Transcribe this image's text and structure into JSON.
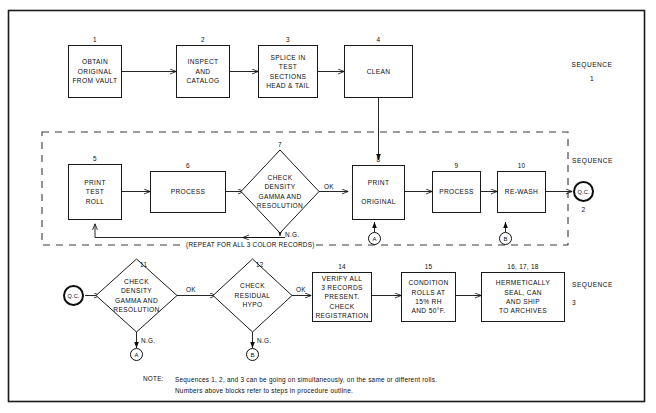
{
  "diagram": {
    "border_color": "#1a1a1a",
    "background": "#ffffff"
  },
  "sequences": [
    {
      "label": "SEQUENCE",
      "number": "1"
    },
    {
      "label": "SEQUENCE",
      "number": "2"
    },
    {
      "label": "SEQUENCE",
      "number": "3"
    }
  ],
  "nodes": {
    "n1": {
      "num": "1",
      "text": "OBTAIN\nORIGINAL\nFROM VAULT"
    },
    "n2": {
      "num": "2",
      "text": "INSPECT\nAND\nCATALOG"
    },
    "n3": {
      "num": "3",
      "text": "SPLICE IN\nTEST\nSECTIONS\nHEAD & TAIL"
    },
    "n4": {
      "num": "4",
      "text": "CLEAN"
    },
    "n5": {
      "num": "5",
      "text": "PRINT\nTEST\nROLL"
    },
    "n6": {
      "num": "6",
      "text": "PROCESS"
    },
    "n7": {
      "num": "7",
      "text": "CHECK\nDENSITY\nGAMMA AND\nRESOLUTION"
    },
    "n8": {
      "num": "8",
      "text": "PRINT\n\nORIGINAL"
    },
    "n9": {
      "num": "9",
      "text": "PROCESS"
    },
    "n10": {
      "num": "10",
      "text": "RE-WASH"
    },
    "n11": {
      "num": "11",
      "text": "CHECK\nDENSITY\nGAMMA AND\nRESOLUTION"
    },
    "n12": {
      "num": "12",
      "text": "CHECK\nRESIDUAL\nHYPO"
    },
    "n14": {
      "num": "14",
      "text": "VERIFY ALL\n3 RECORDS\nPRESENT.\nCHECK\nREGISTRATION"
    },
    "n15": {
      "num": "15",
      "text": "CONDITION\nROLLS AT\n15% RH\nAND 50°F."
    },
    "n16": {
      "num": "16, 17, 18",
      "text": "HERMETICALLY\nSEAL, CAN\nAND SHIP\nTO ARCHIVES"
    }
  },
  "connectors": {
    "qc2": "Q.C.",
    "qc3": "Q.C.",
    "a_seq2": "A",
    "b_seq2": "B",
    "a_seq3": "A",
    "b_seq3": "B"
  },
  "edge_labels": {
    "ok7": "OK",
    "ng7": "N.G.",
    "ok11": "OK",
    "ng11": "N.G.",
    "ok12": "OK",
    "ng12": "N.G."
  },
  "repeat_note": "(REPEAT FOR ALL 3 COLOR RECORDS)",
  "note": {
    "label": "NOTE:",
    "line1": "Sequences 1, 2, and 3 can be going on simultaneously, on the same or different rolls.",
    "line2": "Numbers above blocks refer to steps in procedure outline."
  }
}
